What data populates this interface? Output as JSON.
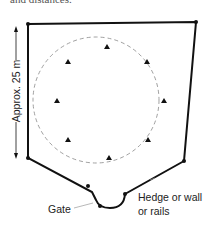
{
  "caption_fragment": "and distances.",
  "labels": {
    "dimension": "Approx. 25 m",
    "gate": "Gate",
    "boundary_line1": "Hedge or wall",
    "boundary_line2": "or rails"
  },
  "enclosure": {
    "outline_points": [
      [
        28,
        24
      ],
      [
        196,
        22
      ],
      [
        184,
        161
      ],
      [
        125,
        194
      ],
      [
        119,
        203
      ],
      [
        100,
        203
      ],
      [
        92,
        192
      ],
      [
        28,
        158
      ]
    ],
    "post_count": 7
  },
  "circle": {
    "cx": 96,
    "cy": 100,
    "r": 63,
    "style": "dashed"
  },
  "markers": {
    "shape": "triangle",
    "count": 8,
    "positions": [
      [
        107,
        47
      ],
      [
        68,
        62
      ],
      [
        147,
        62
      ],
      [
        163,
        101
      ],
      [
        68,
        140
      ],
      [
        148,
        140
      ],
      [
        109,
        158
      ],
      [
        57,
        101
      ]
    ]
  },
  "colors": {
    "line": "#111111",
    "dashed": "#888888",
    "text": "#222222"
  }
}
